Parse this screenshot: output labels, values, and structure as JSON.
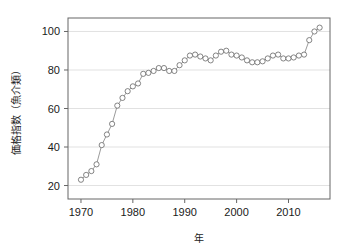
{
  "chart_data": {
    "type": "line",
    "title": "",
    "subtitle": "",
    "xlabel": "年",
    "ylabel": "価格指数（魚介類）",
    "xlim": [
      1967.5,
      1918.0
    ],
    "x_axis_range": [
      1967.5,
      2018.0
    ],
    "ylim": [
      13,
      107
    ],
    "grid": "horizontal",
    "legend": "none",
    "marker": "open-circle",
    "xticks": [
      1970,
      1980,
      1990,
      2000,
      2010
    ],
    "xtick_labels": [
      "1970",
      "1980",
      "1990",
      "2000",
      "2010"
    ],
    "yticks": [
      20,
      40,
      60,
      80,
      100
    ],
    "ytick_labels": [
      "20",
      "40",
      "60",
      "80",
      "100"
    ],
    "x": [
      1970,
      1971,
      1972,
      1973,
      1974,
      1975,
      1976,
      1977,
      1978,
      1979,
      1980,
      1981,
      1982,
      1983,
      1984,
      1985,
      1986,
      1987,
      1988,
      1989,
      1990,
      1991,
      1992,
      1993,
      1994,
      1995,
      1996,
      1997,
      1998,
      1999,
      2000,
      2001,
      2002,
      2003,
      2004,
      2005,
      2006,
      2007,
      2008,
      2009,
      2010,
      2011,
      2012,
      2013,
      2014,
      2015,
      2016
    ],
    "values": [
      23.0,
      25.5,
      27.5,
      31.0,
      41.0,
      46.5,
      52.0,
      61.5,
      65.5,
      69.0,
      71.5,
      73.0,
      78.0,
      78.5,
      79.5,
      81.0,
      81.0,
      79.5,
      79.5,
      82.5,
      85.0,
      87.5,
      88.0,
      87.0,
      86.0,
      85.0,
      87.5,
      89.5,
      90.0,
      88.0,
      87.5,
      86.5,
      85.0,
      84.0,
      84.0,
      84.5,
      86.0,
      87.5,
      88.0,
      86.0,
      86.0,
      86.5,
      87.5,
      88.0,
      95.5,
      100.0,
      102.0
    ],
    "series": [
      {
        "name": "価格指数（魚介類）",
        "values": [
          23.0,
          25.5,
          27.5,
          31.0,
          41.0,
          46.5,
          52.0,
          61.5,
          65.5,
          69.0,
          71.5,
          73.0,
          78.0,
          78.5,
          79.5,
          81.0,
          81.0,
          79.5,
          79.5,
          82.5,
          85.0,
          87.5,
          88.0,
          87.0,
          86.0,
          85.0,
          87.5,
          89.5,
          90.0,
          88.0,
          87.5,
          86.5,
          85.0,
          84.0,
          84.0,
          84.5,
          86.0,
          87.5,
          88.0,
          86.0,
          86.0,
          86.5,
          87.5,
          88.0,
          95.5,
          100.0,
          102.0
        ]
      }
    ],
    "colors": {
      "line": "#808080",
      "marker_stroke": "#666666",
      "marker_fill": "#ffffff",
      "grid": "#d9d9d9",
      "frame": "#666666",
      "text": "#1a1a1a"
    }
  }
}
